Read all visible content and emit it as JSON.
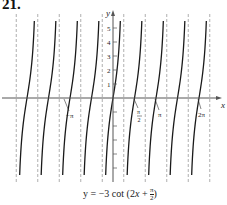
{
  "problem_number": "21.",
  "caption": "y = −3 cot (2x + π/2)",
  "colors": {
    "curve": "#1a1a1a",
    "asymptote": "#9a9a9a",
    "axis": "#555555",
    "text": "#222222"
  },
  "axes": {
    "x_label": "x",
    "y_label": "y",
    "y_tick_labels": [
      "1",
      "2",
      "3",
      "4",
      "5"
    ],
    "x_tick_labels": [
      "−π",
      "π/2",
      "π",
      "2π"
    ]
  },
  "chart_data": {
    "type": "line",
    "title": "",
    "function": "y = -3 cot(2x + π/2)",
    "equivalent": "y = 3 tan(2x)",
    "xlabel": "x",
    "ylabel": "y",
    "period": "π/2",
    "asymptotes": [
      "-9π/4",
      "-7π/4",
      "-5π/4",
      "-3π/4",
      "-π/4",
      "π/4",
      "3π/4",
      "5π/4",
      "7π/4",
      "9π/4"
    ],
    "zeros": [
      "-2π",
      "-3π/2",
      "-π",
      "-π/2",
      "0",
      "π/2",
      "π",
      "3π/2",
      "2π"
    ],
    "xlim": [
      "-5π/2",
      "5π/2"
    ],
    "ylim": [
      -6,
      6
    ],
    "y_ticks": [
      -5,
      -4,
      -3,
      -2,
      -1,
      1,
      2,
      3,
      4,
      5
    ],
    "x_tick_labels": [
      "−π",
      "π/2",
      "π",
      "2π"
    ],
    "grid": false,
    "legend": null
  }
}
